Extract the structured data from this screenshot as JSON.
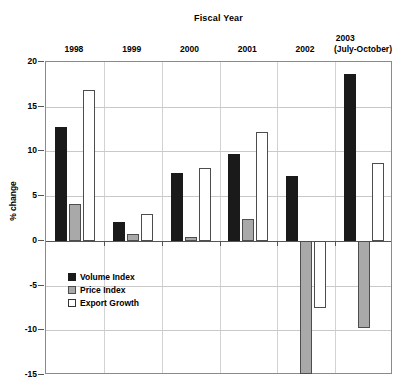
{
  "chart_data": {
    "type": "bar",
    "title": "Fiscal Year",
    "subtitle": "",
    "xlabel": "Fiscal Year",
    "ylabel": "% change",
    "categories": [
      "1998",
      "1999",
      "2000",
      "2001",
      "2002",
      "2003 (July-October)"
    ],
    "category_lines": [
      [
        "1998"
      ],
      [
        "1999"
      ],
      [
        "2000"
      ],
      [
        "2001"
      ],
      [
        "2002"
      ],
      [
        "2003 (July-",
        "October)"
      ]
    ],
    "series": [
      {
        "name": "Volume Index",
        "color": "#1a1a1a",
        "values": [
          12.7,
          2.1,
          7.6,
          9.7,
          7.2,
          18.7
        ]
      },
      {
        "name": "Price Index",
        "color": "#a9a9a9",
        "values": [
          4.1,
          0.8,
          0.4,
          2.4,
          -14.9,
          -9.7
        ]
      },
      {
        "name": "Export Growth",
        "color": "#ffffff",
        "values": [
          16.9,
          3.0,
          8.1,
          12.2,
          -7.5,
          8.7
        ]
      }
    ],
    "ylim": [
      -15,
      20
    ],
    "yticks": [
      20,
      15,
      10,
      5,
      0,
      -5,
      -10,
      -15
    ],
    "ytick_labels": [
      "20",
      "15",
      "10",
      "5",
      "0",
      "-5",
      "-10",
      "-15"
    ],
    "grid": true,
    "legend_position": "inside-lower-left"
  },
  "legend": {
    "items": [
      {
        "label": "Volume Index",
        "swatch": "volume"
      },
      {
        "label": "Price Index",
        "swatch": "price"
      },
      {
        "label": "Export Growth",
        "swatch": "export"
      }
    ]
  },
  "top_stub": "",
  "axis": {
    "y_title": "% change"
  },
  "header": {
    "fiscal_year": "Fiscal Year"
  }
}
